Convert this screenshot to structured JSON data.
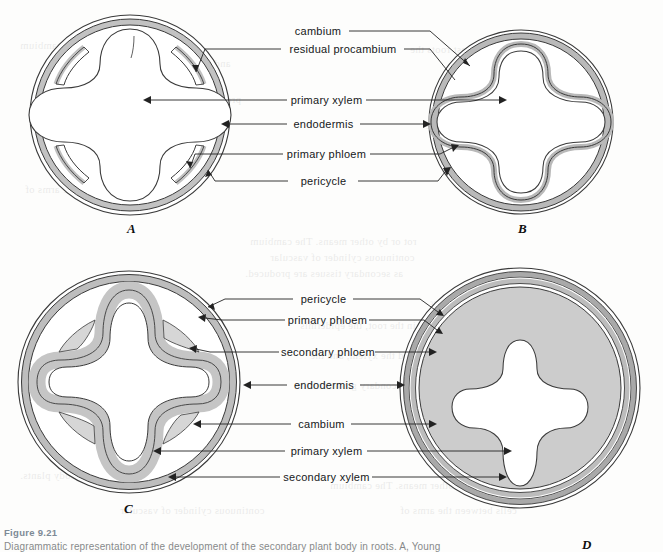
{
  "figure": {
    "caption_title": "Figure 9.21",
    "caption_body": "Diagrammatic representation of the development of the secondary plant body in roots. A, Young"
  },
  "panels": [
    {
      "id": "A",
      "letter": "A"
    },
    {
      "id": "B",
      "letter": "B"
    },
    {
      "id": "C",
      "letter": "C"
    },
    {
      "id": "D",
      "letter": "D"
    }
  ],
  "labels": {
    "top_group": [
      {
        "name": "cambium",
        "text": "cambium"
      },
      {
        "name": "residual-procambium",
        "text": "residual procambium"
      },
      {
        "name": "primary-xylem",
        "text": "primary xylem"
      },
      {
        "name": "endodermis",
        "text": "endodermis"
      },
      {
        "name": "primary-phloem",
        "text": "primary phloem"
      },
      {
        "name": "pericycle",
        "text": "pericycle"
      }
    ],
    "bottom_group": [
      {
        "name": "pericycle",
        "text": "pericycle"
      },
      {
        "name": "primary-phloem",
        "text": "primary phloem"
      },
      {
        "name": "secondary-phloem",
        "text": "secondary phloem"
      },
      {
        "name": "endodermis",
        "text": "endodermis"
      },
      {
        "name": "cambium",
        "text": "cambium"
      },
      {
        "name": "primary-xylem",
        "text": "primary xylem"
      },
      {
        "name": "secondary-xylem",
        "text": "secondary xylem"
      }
    ]
  },
  "colors": {
    "outline": "#3a3a3a",
    "tissue_gray": "#c9c9c9",
    "tissue_gray_light": "#dedede",
    "leader_line": "#222222",
    "caption_title": "#7d8a96",
    "page_background": "#fdfdfc"
  },
  "bleed_text": [
    "rot or by other means. The cambium",
    "and cortex of the root is sloughed off",
    "as secondary tissues are produced.",
    "produced in the root, the epidermis",
    "the phloem and the xylem, and the",
    "continuous cylinder of vascular",
    "arises as a meristem between",
    "cambium then becomes a",
    "cells between the arms of",
    "tissue. In most roots the",
    "the primary xylem, and",
    "secondary growth of the",
    "root continues for many",
    "seasons in woody plants."
  ]
}
